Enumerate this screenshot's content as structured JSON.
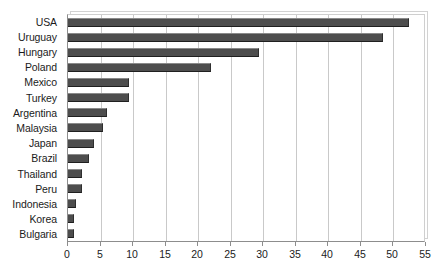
{
  "chart_data": {
    "type": "bar",
    "orientation": "horizontal",
    "title": "",
    "xlabel": "",
    "ylabel": "",
    "categories": [
      "USA",
      "Uruguay",
      "Hungary",
      "Poland",
      "Mexico",
      "Turkey",
      "Argentina",
      "Malaysia",
      "Japan",
      "Brazil",
      "Thailand",
      "Peru",
      "Indonesia",
      "Korea",
      "Bulgaria"
    ],
    "values": [
      52.4,
      48.4,
      29.3,
      22.0,
      9.4,
      9.4,
      6.0,
      5.4,
      4.0,
      3.2,
      2.2,
      2.2,
      1.2,
      0.9,
      0.9
    ],
    "xlim": [
      0,
      55
    ],
    "xticks": [
      0,
      5,
      10,
      15,
      20,
      25,
      30,
      35,
      40,
      45,
      50,
      55
    ],
    "xtick_labels": [
      "0",
      "5",
      "10",
      "15",
      "20",
      "25",
      "30",
      "35",
      "40",
      "45",
      "50",
      "55"
    ],
    "grid": "vertical",
    "legend": null,
    "bar_color": "#4d4d4d",
    "gridline_color": "#c9c9c9",
    "axis_color": "#8d8d8d",
    "text_color": "#1b1b1b",
    "background": "#ffffff"
  }
}
